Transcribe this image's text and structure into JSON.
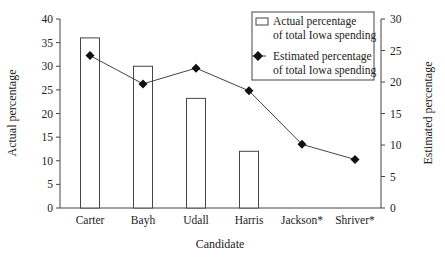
{
  "chart_data": {
    "type": "bar+line",
    "title": "",
    "xlabel": "Candidate",
    "ylabel": "Actual percentage",
    "ylabel_right": "Estimated percentage",
    "categories": [
      "Carter",
      "Bayh",
      "Udall",
      "Harris",
      "Jackson*",
      "Shriver*"
    ],
    "series": [
      {
        "name": "Actual percentage of total Iowa spending",
        "type": "bar",
        "axis": "left",
        "values": [
          36,
          30,
          23.2,
          12,
          null,
          null
        ]
      },
      {
        "name": "Estimated percentage of total Iowa spending",
        "type": "line",
        "axis": "right",
        "marker": "diamond",
        "values": [
          24.2,
          19.7,
          22.2,
          18.6,
          10.1,
          7.7
        ]
      }
    ],
    "ylim": [
      0,
      40
    ],
    "ylim_right": [
      0,
      30
    ],
    "yticks": [
      "0",
      "5",
      "10",
      "15",
      "20",
      "25",
      "30",
      "35",
      "40"
    ],
    "yticks_right": [
      "0",
      "5",
      "10",
      "15",
      "20",
      "25",
      "30"
    ],
    "legend": {
      "position": "upper right",
      "entries": [
        {
          "line1": "Actual percentage",
          "line2": "of total Iowa spending"
        },
        {
          "line1": "Estimated percentage",
          "line2": "of total Iowa spending"
        }
      ]
    },
    "grid": false
  }
}
